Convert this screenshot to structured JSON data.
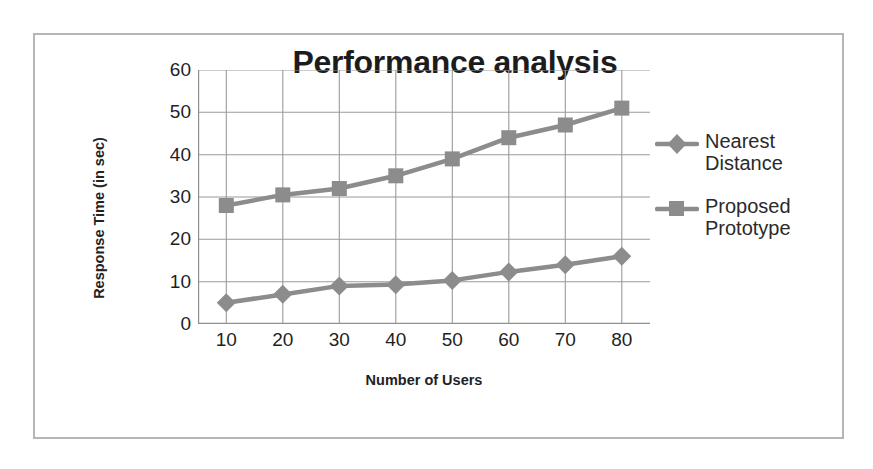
{
  "chart_data": {
    "type": "line",
    "title": "Performance analysis",
    "xlabel": "Number of Users",
    "ylabel": "Response Time (in sec)",
    "categories": [
      10,
      20,
      30,
      40,
      50,
      60,
      70,
      80
    ],
    "x": [
      10,
      20,
      30,
      40,
      50,
      60,
      70,
      80
    ],
    "xtick_labels": [
      "10",
      "20",
      "30",
      "40",
      "50",
      "60",
      "70",
      "80"
    ],
    "ytick_labels": [
      "60",
      "50",
      "40",
      "30",
      "20",
      "10",
      "0"
    ],
    "yticks": [
      60,
      50,
      40,
      30,
      20,
      10,
      0
    ],
    "xlim": [
      5,
      85
    ],
    "ylim": [
      0,
      60
    ],
    "grid": true,
    "legend_position": "right",
    "series": [
      {
        "name": "Nearest Distance",
        "marker": "diamond",
        "color": "#8c8c8c",
        "values": [
          5,
          7,
          9,
          9.3,
          10.3,
          12.3,
          14,
          16
        ]
      },
      {
        "name": "Proposed Prototype",
        "marker": "square",
        "color": "#8c8c8c",
        "values": [
          28,
          30.5,
          32,
          35,
          39,
          44,
          47,
          51
        ]
      }
    ]
  },
  "legend": {
    "entries": [
      {
        "label": "Nearest Distance"
      },
      {
        "label": "Proposed Prototype"
      }
    ]
  },
  "colors": {
    "series": "#8c8c8c",
    "gridline": "#9a9a9a",
    "axis": "#8f8f8f",
    "frame": "#b5b5b5",
    "text": "#1f1f1f"
  }
}
